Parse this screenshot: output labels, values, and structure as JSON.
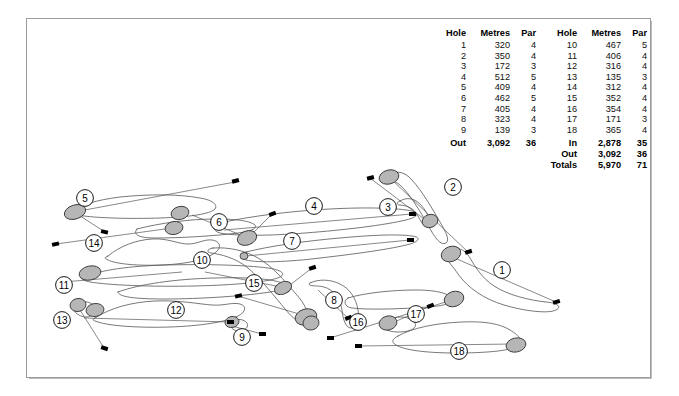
{
  "document": {
    "title": "Golf Course Layout Map",
    "background_color": "#ffffff",
    "frame_color": "#9b9b9b"
  },
  "scorecard": {
    "out_table": {
      "headers": {
        "hole": "Hole",
        "metres": "Metres",
        "par": "Par"
      },
      "rows": [
        {
          "hole": "1",
          "metres": "320",
          "par": "4"
        },
        {
          "hole": "2",
          "metres": "350",
          "par": "4"
        },
        {
          "hole": "3",
          "metres": "172",
          "par": "3"
        },
        {
          "hole": "4",
          "metres": "512",
          "par": "5"
        },
        {
          "hole": "5",
          "metres": "409",
          "par": "4"
        },
        {
          "hole": "6",
          "metres": "462",
          "par": "5"
        },
        {
          "hole": "7",
          "metres": "405",
          "par": "4"
        },
        {
          "hole": "8",
          "metres": "323",
          "par": "4"
        },
        {
          "hole": "9",
          "metres": "139",
          "par": "3"
        }
      ],
      "totals": [
        {
          "label": "Out",
          "metres": "3,092",
          "par": "36"
        }
      ]
    },
    "in_table": {
      "headers": {
        "hole": "Hole",
        "metres": "Metres",
        "par": "Par"
      },
      "rows": [
        {
          "hole": "10",
          "metres": "467",
          "par": "5"
        },
        {
          "hole": "11",
          "metres": "406",
          "par": "4"
        },
        {
          "hole": "12",
          "metres": "316",
          "par": "4"
        },
        {
          "hole": "13",
          "metres": "135",
          "par": "3"
        },
        {
          "hole": "14",
          "metres": "312",
          "par": "4"
        },
        {
          "hole": "15",
          "metres": "352",
          "par": "4"
        },
        {
          "hole": "16",
          "metres": "354",
          "par": "4"
        },
        {
          "hole": "17",
          "metres": "171",
          "par": "3"
        },
        {
          "hole": "18",
          "metres": "365",
          "par": "4"
        }
      ],
      "totals": [
        {
          "label": "In",
          "metres": "2,878",
          "par": "35"
        },
        {
          "label": "Out",
          "metres": "3,092",
          "par": "36"
        },
        {
          "label": "Totals",
          "metres": "5,970",
          "par": "71"
        }
      ]
    }
  },
  "map": {
    "green_fill": "#b6b6b6",
    "green_stroke": "#3a3a3a",
    "fairway_stroke": "#555555",
    "tee_fill": "#000000",
    "marker_stroke": "#000000",
    "hole_markers": [
      {
        "number": "1",
        "x": 502,
        "y": 270
      },
      {
        "number": "2",
        "x": 453,
        "y": 187
      },
      {
        "number": "3",
        "x": 388,
        "y": 207
      },
      {
        "number": "4",
        "x": 314,
        "y": 206
      },
      {
        "number": "5",
        "x": 85,
        "y": 198
      },
      {
        "number": "6",
        "x": 219,
        "y": 222
      },
      {
        "number": "7",
        "x": 292,
        "y": 241
      },
      {
        "number": "8",
        "x": 334,
        "y": 300
      },
      {
        "number": "9",
        "x": 242,
        "y": 337
      },
      {
        "number": "10",
        "x": 202,
        "y": 260
      },
      {
        "number": "11",
        "x": 64,
        "y": 285
      },
      {
        "number": "12",
        "x": 176,
        "y": 310
      },
      {
        "number": "13",
        "x": 62,
        "y": 320
      },
      {
        "number": "14",
        "x": 94,
        "y": 243
      },
      {
        "number": "15",
        "x": 254,
        "y": 283
      },
      {
        "number": "16",
        "x": 358,
        "y": 322
      },
      {
        "number": "17",
        "x": 416,
        "y": 314
      },
      {
        "number": "18",
        "x": 459,
        "y": 351
      }
    ]
  }
}
